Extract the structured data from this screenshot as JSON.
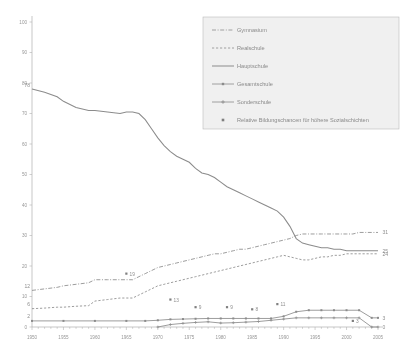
{
  "chart_data": {
    "type": "line",
    "title": "",
    "subtitle": "",
    "xlabel": "",
    "ylabel": "",
    "xlim": [
      1950,
      2005
    ],
    "ylim": [
      0,
      100
    ],
    "ytick_step": 10,
    "xtick_step": 5,
    "grid": false,
    "legend_position": "top-right",
    "yticks": [
      "0",
      "10",
      "20",
      "30",
      "40",
      "50",
      "60",
      "70",
      "80",
      "90",
      "100"
    ],
    "xticks": [
      "1950",
      "1955",
      "1960",
      "1965",
      "1970",
      "1975",
      "1980",
      "1985",
      "1990",
      "1995",
      "2000",
      "2005"
    ],
    "series": [
      {
        "name": "Gymnasium",
        "style": "dash-dot",
        "end_label": "31",
        "start_label": "12",
        "x": [
          1950,
          1952,
          1954,
          1955,
          1957,
          1959,
          1960,
          1962,
          1964,
          1965,
          1966,
          1967,
          1968,
          1969,
          1970,
          1971,
          1972,
          1973,
          1974,
          1975,
          1976,
          1977,
          1978,
          1979,
          1980,
          1981,
          1982,
          1983,
          1984,
          1985,
          1986,
          1987,
          1988,
          1989,
          1990,
          1991,
          1992,
          1993,
          1994,
          1995,
          1996,
          1997,
          1998,
          1999,
          2000,
          2001,
          2002,
          2003,
          2004,
          2005
        ],
        "values": [
          12,
          12.5,
          13,
          13.5,
          14,
          14.5,
          15.5,
          15.5,
          15.5,
          15.5,
          15.5,
          16.5,
          17.5,
          18.5,
          19.5,
          20,
          20.5,
          21,
          21.5,
          22,
          22.5,
          23,
          23.5,
          24,
          24,
          24.5,
          25,
          25.5,
          25.5,
          26,
          26.5,
          27,
          27.5,
          28,
          28.5,
          29,
          30,
          30.5,
          30.5,
          30.5,
          30.5,
          30.5,
          30.5,
          30.5,
          30.5,
          30.5,
          31,
          31,
          31,
          31
        ]
      },
      {
        "name": "Realschule",
        "style": "dashed",
        "end_label": "24",
        "start_label": "6",
        "x": [
          1950,
          1952,
          1954,
          1955,
          1957,
          1959,
          1960,
          1962,
          1964,
          1965,
          1966,
          1967,
          1968,
          1969,
          1970,
          1971,
          1972,
          1973,
          1974,
          1975,
          1976,
          1977,
          1978,
          1979,
          1980,
          1981,
          1982,
          1983,
          1984,
          1985,
          1986,
          1987,
          1988,
          1989,
          1990,
          1991,
          1992,
          1993,
          1994,
          1995,
          1996,
          1997,
          1998,
          1999,
          2000,
          2001,
          2002,
          2003,
          2004,
          2005
        ],
        "values": [
          6,
          6.2,
          6.5,
          6.5,
          6.8,
          7,
          8.5,
          9,
          9.5,
          9.5,
          9.5,
          10.5,
          11.5,
          12.5,
          13.5,
          14,
          14.5,
          15,
          15.5,
          16,
          16.5,
          17,
          17.5,
          18,
          18.5,
          19,
          19.5,
          20,
          20.5,
          21,
          21.5,
          22,
          22.5,
          23,
          23.5,
          23,
          22.5,
          22,
          22,
          22.5,
          23,
          23,
          23.5,
          23.5,
          24,
          24,
          24,
          24,
          24,
          24
        ]
      },
      {
        "name": "Hauptschule",
        "style": "solid",
        "end_label": "25",
        "start_label": "78",
        "x": [
          1950,
          1952,
          1954,
          1955,
          1957,
          1959,
          1960,
          1962,
          1964,
          1965,
          1966,
          1967,
          1968,
          1969,
          1970,
          1971,
          1972,
          1973,
          1974,
          1975,
          1976,
          1977,
          1978,
          1979,
          1980,
          1981,
          1982,
          1983,
          1984,
          1985,
          1986,
          1987,
          1988,
          1989,
          1990,
          1991,
          1992,
          1993,
          1994,
          1995,
          1996,
          1997,
          1998,
          1999,
          2000,
          2001,
          2002,
          2003,
          2004,
          2005
        ],
        "values": [
          78,
          77,
          75.5,
          74,
          72,
          71,
          71,
          70.5,
          70,
          70.5,
          70.5,
          70,
          68,
          65,
          62,
          59.5,
          57.5,
          56,
          55,
          54,
          52,
          50.5,
          50,
          49,
          47.5,
          46,
          45,
          44,
          43,
          42,
          41,
          40,
          39,
          38,
          36,
          33,
          29,
          27.5,
          27,
          26.5,
          26,
          26,
          25.5,
          25.5,
          25,
          25,
          25,
          25,
          25,
          25
        ]
      },
      {
        "name": "Gesamtschule",
        "style": "solid-marker-square",
        "end_label": "3",
        "start_label": "2",
        "x": [
          1950,
          1955,
          1960,
          1965,
          1968,
          1970,
          1972,
          1974,
          1976,
          1978,
          1980,
          1982,
          1984,
          1986,
          1988,
          1990,
          1992,
          1994,
          1996,
          1998,
          2000,
          2002,
          2004,
          2005
        ],
        "values": [
          2,
          2,
          2,
          2,
          2,
          2.2,
          2.5,
          2.6,
          2.7,
          2.8,
          2.8,
          2.8,
          2.8,
          2.8,
          2.8,
          3.5,
          5,
          5.5,
          5.5,
          5.5,
          5.5,
          5.5,
          3,
          3
        ]
      },
      {
        "name": "Sonderschule",
        "style": "solid-marker-plus",
        "end_label": "0",
        "start_label": "",
        "x": [
          1970,
          1972,
          1974,
          1976,
          1978,
          1980,
          1982,
          1984,
          1986,
          1988,
          1990,
          1992,
          1994,
          1996,
          1998,
          2000,
          2002,
          2004,
          2005
        ],
        "values": [
          0,
          0.8,
          1.2,
          1.5,
          1.7,
          1.3,
          1.4,
          1.6,
          1.8,
          2.2,
          2.6,
          3,
          3,
          3,
          3,
          3,
          3,
          0,
          0
        ]
      }
    ],
    "scatter": {
      "name": "Relative Bildungschancen für höhere Sozialschichten",
      "points": [
        {
          "x": 1965,
          "y": 17.5,
          "label": "19"
        },
        {
          "x": 1972,
          "y": 9.0,
          "label": "13"
        },
        {
          "x": 1976,
          "y": 6.5,
          "label": "9"
        },
        {
          "x": 1981,
          "y": 6.5,
          "label": "9"
        },
        {
          "x": 1985,
          "y": 5.8,
          "label": "8"
        },
        {
          "x": 1989,
          "y": 7.5,
          "label": "11"
        },
        {
          "x": 2001,
          "y": 2.0,
          "label": "3"
        }
      ]
    }
  },
  "legend": {
    "items": [
      {
        "label": "Gymnasium",
        "marker": "dash-dot-line"
      },
      {
        "label": "Realschule",
        "marker": "dashed-line"
      },
      {
        "label": "Hauptschule",
        "marker": "solid-line"
      },
      {
        "label": "Gesamtschule",
        "marker": "square-marker-line"
      },
      {
        "label": "Sonderschule",
        "marker": "plus-marker-line"
      },
      {
        "label": "Relative Bildungschancen für höhere Sozialschichten",
        "marker": "square-dot"
      }
    ]
  }
}
